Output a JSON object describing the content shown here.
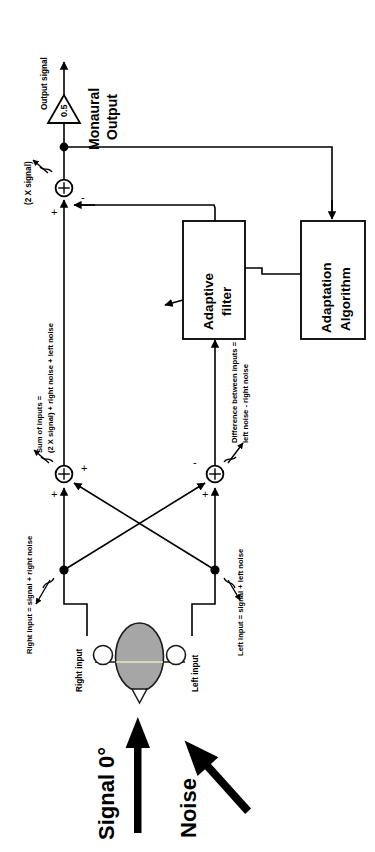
{
  "figure": {
    "orientation": "rotated-90-ccw",
    "colors": {
      "stroke": "#000000",
      "background": "#ffffff",
      "head_fill": "#a6a6a6",
      "ear_fill": "#ffffff",
      "midline": "#e8e8c0"
    }
  },
  "labels": {
    "output_signal": "Output signal",
    "gain": "0.5",
    "monaural_output": "Monaural\nOutput",
    "monaural_output_line1": "Monaural",
    "monaural_output_line2": "Output",
    "two_x_signal": "(2 X signal)",
    "sum_of_inputs_line1": "Sum of inputs =",
    "sum_of_inputs_line2": "(2 X signal) + right noise + left noise",
    "difference_line1": "Difference between inputs =",
    "difference_line2": "left noise - right noise",
    "right_input_eq": "Right input = signal + right noise",
    "left_input_eq": "Left input = signal + left noise",
    "right_input": "Right input",
    "left_input": "Left input",
    "signal": "Signal 0°",
    "noise": "Noise"
  },
  "blocks": [
    {
      "id": "adaptive-filter",
      "line1": "Adaptive",
      "line2": "filter"
    },
    {
      "id": "adaptation-algorithm",
      "line1": "Adaptation",
      "line2": "Algorithm"
    }
  ],
  "summing_junctions": [
    {
      "id": "output-summer",
      "glyph": "+",
      "inputs": [
        "+",
        "-"
      ]
    },
    {
      "id": "sum-summer",
      "glyph": "+",
      "inputs": [
        "+",
        "+"
      ]
    },
    {
      "id": "difference-summer",
      "glyph": "+",
      "inputs": [
        "+",
        "-"
      ]
    }
  ],
  "signs": {
    "plus": "+",
    "minus": "-"
  },
  "gain_block": {
    "id": "gain-triangle",
    "value": "0.5"
  }
}
